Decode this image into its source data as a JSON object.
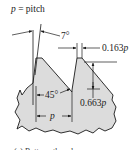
{
  "figure": {
    "colors": {
      "fill": "#dcdcdc",
      "stroke": "#1a1a1a",
      "text": "#222222",
      "background": "#ffffff"
    },
    "labels": {
      "pitch_var": "p",
      "pitch_eq": " = pitch",
      "angle_small": "7°",
      "angle_large": "45°",
      "crest_width": "0.163",
      "crest_width_var": "p",
      "depth": "0.663",
      "depth_var": "p",
      "pitch_dim": "p"
    },
    "caption": "(a) Buttress thread"
  }
}
